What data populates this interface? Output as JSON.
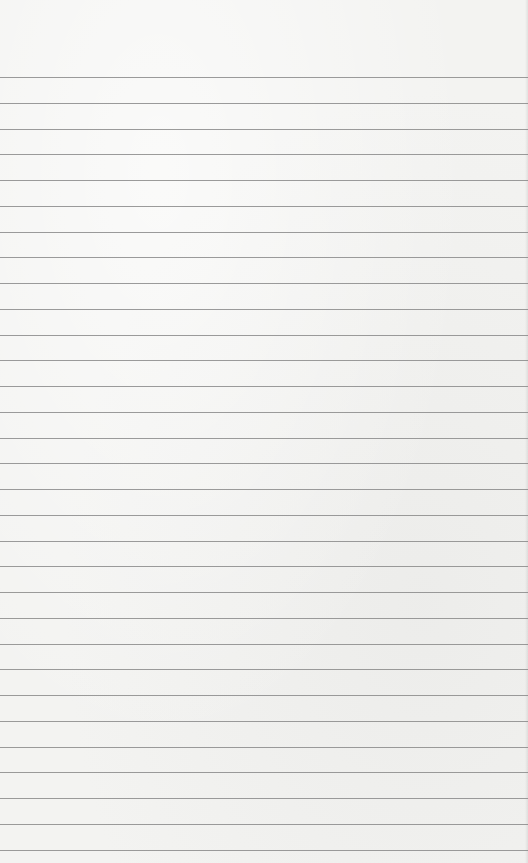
{
  "paper": {
    "type": "lined-paper",
    "background_color": "#f3f3f1",
    "line_color": "#8a8a8a",
    "first_line_y": 77,
    "line_spacing": 25.75,
    "line_count": 31
  }
}
